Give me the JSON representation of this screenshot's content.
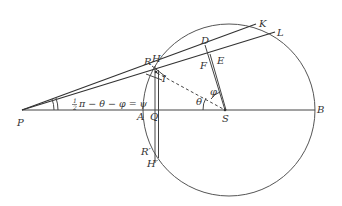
{
  "figure": {
    "type": "geometric-diagram",
    "stroke_color": "#444444",
    "background": "#ffffff",
    "points": {
      "P": "P",
      "A": "A",
      "Q": "Q",
      "S": "S",
      "B": "B",
      "R": "R",
      "H": "H",
      "I": "I",
      "D": "D",
      "E": "E",
      "F": "F",
      "K": "K",
      "L": "L",
      "R_prime": "R′",
      "H_prime": "H′"
    },
    "angles": {
      "theta": "θ",
      "phi": "φ"
    },
    "equation": {
      "half_num": "1",
      "half_den": "2",
      "text": "π − θ − φ = ψ"
    }
  }
}
